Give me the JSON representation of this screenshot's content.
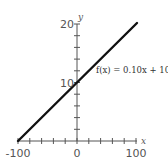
{
  "chart_data": {
    "type": "line",
    "title": "",
    "xlabel": "x",
    "ylabel": "y",
    "xlim": [
      -100,
      100
    ],
    "ylim": [
      0,
      20
    ],
    "grid": false,
    "x_ticks": [
      -100,
      -80,
      -60,
      -40,
      -20,
      0,
      20,
      40,
      60,
      80,
      100
    ],
    "y_ticks": [
      0,
      2,
      4,
      6,
      8,
      10,
      12,
      14,
      16,
      18,
      20
    ],
    "x_tick_labels": [
      "-100",
      "0",
      "100"
    ],
    "y_tick_labels": [
      "10",
      "20"
    ],
    "series": [
      {
        "name": "f(x) = 0.10x + 10",
        "x": [
          -100,
          100
        ],
        "values": [
          0,
          20
        ]
      }
    ],
    "annotations": [
      {
        "text": "f(x) = 0.10x + 10",
        "x": 20,
        "y": 13
      }
    ]
  },
  "labels": {
    "x_axis": "x",
    "y_axis": "y",
    "x_min": "-100",
    "x_zero": "0",
    "x_max": "100",
    "y_mid": "10",
    "y_max": "20",
    "function": "f(x) = 0.10x + 10"
  }
}
